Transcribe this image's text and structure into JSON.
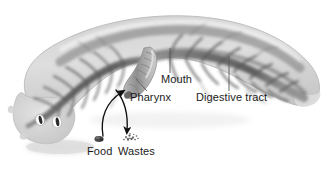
{
  "figure": {
    "background_color": "#ffffff",
    "label_color": "#1b1b1b",
    "body_fill_light": "#d9d9d9",
    "body_fill_mid": "#a8a8a8",
    "body_fill_dark": "#6a6a6a",
    "tract_dark": "#4a4a4a",
    "leader_color": "#555555",
    "arrow_color": "#111111"
  },
  "labels": {
    "mouth": "Mouth",
    "pharynx": "Pharynx",
    "digestive_tract": "Digestive tract",
    "food": "Food",
    "wastes": "Wastes"
  },
  "icons": {
    "food": "food-particle-icon",
    "wastes": "waste-particles-icon",
    "eyespot_left": "eyespot-icon",
    "eyespot_right": "eyespot-icon"
  },
  "arrows": {
    "food_in": "curved-arrow-up-into-pharynx",
    "wastes_out": "curved-arrow-down-out-of-pharynx"
  },
  "anatomy": [
    {
      "name": "head",
      "description": "broad anterior end with two eyespots"
    },
    {
      "name": "pharynx",
      "description": "muscular tube protruding ventrally from mid-body"
    },
    {
      "name": "mouth",
      "description": "opening at the tip of the pharynx"
    },
    {
      "name": "digestive tract",
      "description": "branched gastrovascular cavity with lateral diverticula"
    },
    {
      "name": "tail",
      "description": "tapered posterior end"
    }
  ]
}
